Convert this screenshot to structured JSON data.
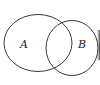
{
  "diagram": {
    "type": "venn",
    "sets": [
      {
        "label": "A",
        "cx": 38,
        "cy": 43,
        "rx": 34,
        "ry": 28.5
      },
      {
        "label": "B",
        "cx": 72,
        "cy": 48,
        "rx": 26,
        "ry": 27.5
      }
    ],
    "stroke_color": "#3a3a3a",
    "shadow_color": "#333333"
  }
}
